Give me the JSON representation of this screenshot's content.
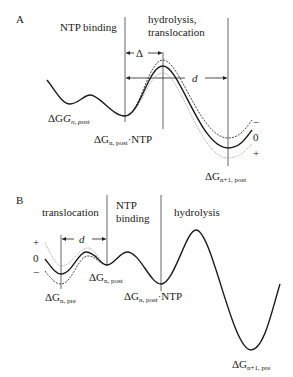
{
  "panel_a": {
    "letter": "A",
    "regions": {
      "left": "NTP binding",
      "right_line1": "hydrolysis,",
      "right_line2": "translocation"
    },
    "delta_label": "Δ",
    "d_label": "d",
    "state_labels": {
      "n_post": {
        "base": "ΔG",
        "sub": "n, post"
      },
      "n_post_ntp": {
        "base": "ΔG",
        "sub": "n, post",
        "suffix": "·NTP"
      },
      "n1_post": {
        "base": "ΔG",
        "sub": "n+1, post"
      }
    },
    "force_signs": [
      "−",
      "0",
      "+"
    ]
  },
  "panel_b": {
    "letter": "B",
    "regions": {
      "left": "translocation",
      "middle_line1": "NTP",
      "middle_line2": "binding",
      "right": "hydrolysis"
    },
    "d_label": "d",
    "state_labels": {
      "n_pre": {
        "base": "ΔG",
        "sub": "n, pre"
      },
      "n_post": {
        "base": "ΔG",
        "sub": "n, post"
      },
      "n_post_ntp": {
        "base": "ΔG",
        "sub": "n, post",
        "suffix": "·NTP"
      },
      "n1_pre": {
        "base": "ΔG",
        "sub": "n+1, pre"
      }
    },
    "force_signs": [
      "+",
      "0",
      "−"
    ]
  },
  "colors": {
    "curve": "#1a1a1a",
    "dashed": "#333333",
    "dotted": "#888888",
    "line": "#555555"
  }
}
